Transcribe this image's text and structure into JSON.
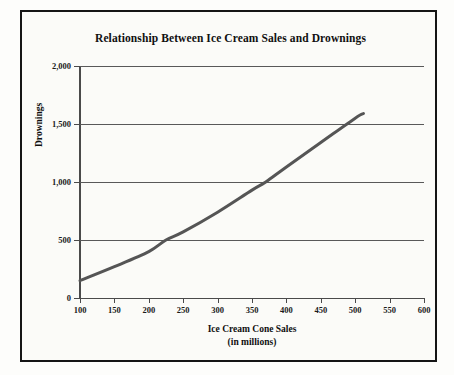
{
  "chart_data": {
    "type": "line",
    "title": "Relationship Between Ice Cream Sales and Drownings",
    "xlabel": "Ice Cream Cone Sales",
    "xlabel_sub": "(in millions)",
    "ylabel": "Drownings",
    "xlim": [
      100,
      600
    ],
    "ylim": [
      0,
      2000
    ],
    "xticks": [
      100,
      150,
      200,
      250,
      300,
      350,
      400,
      450,
      500,
      550,
      600
    ],
    "xtick_labels": [
      "100",
      "150",
      "200",
      "250",
      "300",
      "350",
      "400",
      "450",
      "500",
      "550",
      "600"
    ],
    "yticks": [
      0,
      500,
      1000,
      1500,
      2000
    ],
    "ytick_labels": [
      "0",
      "500",
      "1,000",
      "1,500",
      "2,000"
    ],
    "grid": "horizontal",
    "legend": "none",
    "series": [
      {
        "name": "Drownings vs Ice Cream Cone Sales",
        "color": "#555555",
        "line_width": 3,
        "x": [
          100,
          150,
          200,
          225,
          250,
          300,
          350,
          370,
          400,
          450,
          500,
          512
        ],
        "y": [
          150,
          270,
          400,
          500,
          570,
          740,
          930,
          1000,
          1130,
          1340,
          1550,
          1590
        ]
      }
    ]
  },
  "colors": {
    "background": "#fbfbf8",
    "frame": "#151515",
    "axis": "#4a4a4a",
    "gridline": "#595959",
    "curve": "#555555",
    "text": "#101010"
  }
}
